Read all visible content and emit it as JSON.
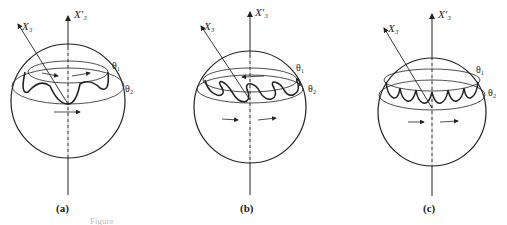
{
  "figure": {
    "panels": [
      {
        "id": "a",
        "label": "(a)",
        "axis_fixed": "X′₃",
        "axis_body": "X₃",
        "theta_upper": "θ₁",
        "theta_lower": "θ₂",
        "motion": "wavy (nutation without loops)"
      },
      {
        "id": "b",
        "label": "(b)",
        "axis_fixed": "X′₃",
        "axis_body": "X₃",
        "theta_upper": "θ₁",
        "theta_lower": "θ₂",
        "motion": "looping"
      },
      {
        "id": "c",
        "label": "(c)",
        "axis_fixed": "X′₃",
        "axis_body": "X₃",
        "theta_upper": "θ₁",
        "theta_lower": "θ₂",
        "motion": "cusped"
      }
    ],
    "caption": "Figure"
  }
}
